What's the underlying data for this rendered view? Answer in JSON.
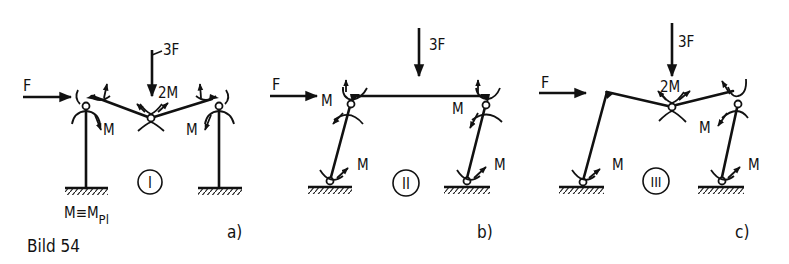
{
  "figure": {
    "caption": "Bild 54",
    "ink_color": "#111111",
    "background": "#ffffff"
  },
  "panels": [
    {
      "id": "a",
      "label": "a)",
      "mechanism": "I",
      "loads": {
        "horizontal": "F",
        "vertical": "3F"
      },
      "moments": [
        "M",
        "2M",
        "M"
      ],
      "note": "M≡M",
      "note_subscript": "Pl"
    },
    {
      "id": "b",
      "label": "b)",
      "mechanism": "II",
      "loads": {
        "horizontal": "F",
        "vertical": "3F"
      },
      "moments": [
        "M",
        "M",
        "M",
        "M"
      ]
    },
    {
      "id": "c",
      "label": "c)",
      "mechanism": "III",
      "loads": {
        "horizontal": "F",
        "vertical": "3F"
      },
      "moments": [
        "2M",
        "M",
        "M",
        "M"
      ]
    }
  ]
}
